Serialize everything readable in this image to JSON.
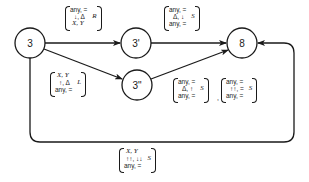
{
  "diagram": {
    "nodes": [
      {
        "id": "3",
        "label": "3",
        "cx": 30,
        "cy": 43
      },
      {
        "id": "3p",
        "label": "3'",
        "cx": 136,
        "cy": 43
      },
      {
        "id": "3pp",
        "label": "3\"",
        "cx": 137,
        "cy": 85
      },
      {
        "id": "8",
        "label": "8",
        "cx": 242,
        "cy": 43
      }
    ],
    "edges": [
      {
        "from": "3",
        "to": "3p",
        "label": {
          "rows": [
            "any, =",
            "↓, Δ",
            "X, Y"
          ],
          "side": "R"
        }
      },
      {
        "from": "3",
        "to": "3pp",
        "label": {
          "rows": [
            "X, Y",
            "↑, Δ",
            "any, ="
          ],
          "side": "L"
        }
      },
      {
        "from": "3p",
        "to": "8",
        "label": {
          "rows": [
            "any, =",
            "Δ, ↓",
            "any, ="
          ],
          "side": "S"
        }
      },
      {
        "from": "3pp",
        "to": "8",
        "label_a": {
          "rows": [
            "any, =",
            "Δ, ↑",
            "any, ="
          ],
          "side": "S"
        },
        "separator": ",",
        "label_b": {
          "rows": [
            "any, =",
            "↑↑, =",
            "any, ="
          ],
          "side": "S"
        }
      },
      {
        "from": "3",
        "to": "8",
        "via": "loop",
        "label": {
          "rows": [
            "X, Y",
            "↑↑, ↓↓",
            "any, ="
          ],
          "side": "S"
        }
      }
    ]
  }
}
